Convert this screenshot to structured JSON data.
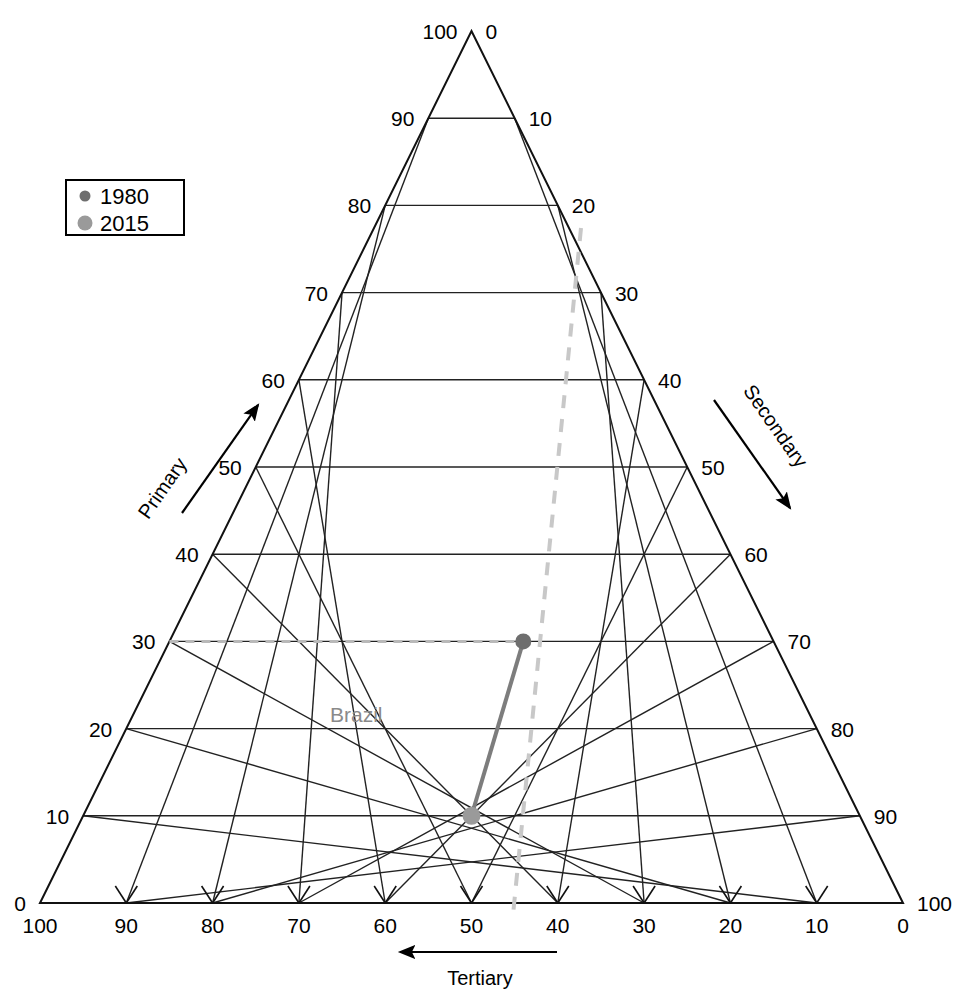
{
  "chart_data": {
    "type": "scatter",
    "chart_kind": "ternary-diagram",
    "title": "",
    "axes": {
      "left": {
        "label": "Primary",
        "direction": "up-right",
        "ticks": [
          0,
          10,
          20,
          30,
          40,
          50,
          60,
          70,
          80,
          90,
          100
        ]
      },
      "right": {
        "label": "Secondary",
        "direction": "down-right",
        "ticks": [
          0,
          10,
          20,
          30,
          40,
          50,
          60,
          70,
          80,
          90,
          100
        ]
      },
      "bottom": {
        "label": "Tertiary",
        "direction": "left",
        "ticks": [
          100,
          90,
          80,
          70,
          60,
          50,
          40,
          30,
          20,
          10,
          0
        ]
      }
    },
    "grid": true,
    "legend": {
      "position": "top-left",
      "entries": [
        {
          "label": "1980",
          "color": "#6e6e6e",
          "size": 7
        },
        {
          "label": "2015",
          "color": "#9a9a9a",
          "size": 11
        }
      ]
    },
    "series": [
      {
        "name": "Brazil",
        "label": "Brazil",
        "points": [
          {
            "year": "1980",
            "primary": 30,
            "secondary": 41,
            "tertiary": 29,
            "color": "#6e6e6e"
          },
          {
            "year": "2015",
            "primary": 10,
            "secondary": 45,
            "tertiary": 45,
            "color": "#9a9a9a"
          }
        ],
        "connector": "solid-gray"
      }
    ],
    "annotations": [
      {
        "type": "dashed-guide",
        "color": "#c8c8c8",
        "description": "diagonal dashed reference line"
      },
      {
        "type": "dashed-guide-horizontal",
        "color": "#b9b9b9",
        "description": "horizontal dashed line from left axis 30 tick to 1980 point"
      }
    ]
  },
  "legend": {
    "entries": [
      {
        "label": "1980"
      },
      {
        "label": "2015"
      }
    ]
  },
  "axis_titles": {
    "primary": "Primary",
    "secondary": "Secondary",
    "tertiary": "Tertiary"
  },
  "labels": {
    "brazil": "Brazil"
  },
  "ticks": {
    "left": [
      "100",
      "90",
      "80",
      "70",
      "60",
      "50",
      "40",
      "30",
      "20",
      "10",
      "0"
    ],
    "right": [
      "0",
      "10",
      "20",
      "30",
      "40",
      "50",
      "60",
      "70",
      "80",
      "90",
      "100"
    ],
    "bottom": [
      "100",
      "90",
      "80",
      "70",
      "60",
      "50",
      "40",
      "30",
      "20",
      "10",
      "0"
    ]
  },
  "colors": {
    "grid": "#222222",
    "outline": "#111111",
    "point_1980": "#6e6e6e",
    "point_2015": "#9a9a9a",
    "guide_dashed": "#c8c8c8",
    "trajectory": "#7d7d7d",
    "brazil_label": "#8a8a8a"
  }
}
